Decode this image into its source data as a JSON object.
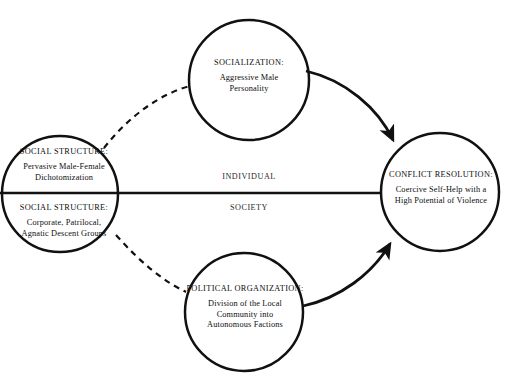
{
  "diagram": {
    "background_color": "#ffffff",
    "stroke_color": "#111111",
    "nodes": [
      {
        "id": "social-structure-dichotomization",
        "title": "SOCIAL STRUCTURE:",
        "lines": [
          "Pervasive Male-Female",
          "Dichotomization"
        ],
        "shape": "circle",
        "cx": 60,
        "cy": 194,
        "r": 58,
        "half": "individual"
      },
      {
        "id": "social-structure-descent-groups",
        "title": "SOCIAL STRUCTURE:",
        "lines": [
          "Corporate, Patrilocal,",
          "Agnatic Descent Groups"
        ],
        "shape": "circle",
        "cx": 60,
        "cy": 194,
        "r": 58,
        "half": "society"
      },
      {
        "id": "socialization",
        "title": "SOCIALIZATION:",
        "lines": [
          "Aggressive Male",
          "Personality"
        ],
        "shape": "circle",
        "cx": 249,
        "cy": 80,
        "r": 60,
        "half": "individual"
      },
      {
        "id": "political-organization",
        "title": "POLITICAL ORGANIZATION:",
        "lines": [
          "Division of the Local",
          "Community into",
          "Autonomous Factions"
        ],
        "shape": "circle",
        "cx": 244,
        "cy": 312,
        "r": 59,
        "half": "society"
      },
      {
        "id": "conflict-resolution",
        "title": "CONFLICT RESOLUTION:",
        "lines": [
          "Coercive Self-Help with a",
          "High Potential of Violence"
        ],
        "shape": "circle",
        "cx": 440,
        "cy": 192,
        "r": 59,
        "half": "both"
      }
    ],
    "divider": {
      "upper_label": "INDIVIDUAL",
      "lower_label": "SOCIETY",
      "y": 193,
      "x_start": 0,
      "x_end": 381,
      "style": "solid"
    },
    "edges": [
      {
        "id": "edge-structure-to-socialization",
        "from": "social-structure-dichotomization",
        "to": "socialization",
        "style": "dashed",
        "arrowhead": false
      },
      {
        "id": "edge-structure-to-political",
        "from": "social-structure-descent-groups",
        "to": "political-organization",
        "style": "dashed",
        "arrowhead": false
      },
      {
        "id": "edge-socialization-to-conflict",
        "from": "socialization",
        "to": "conflict-resolution",
        "style": "solid",
        "arrowhead": true
      },
      {
        "id": "edge-political-to-conflict",
        "from": "political-organization",
        "to": "conflict-resolution",
        "style": "solid",
        "arrowhead": true
      },
      {
        "id": "edge-structure-to-conflict",
        "from": "social-structure",
        "to": "conflict-resolution",
        "style": "solid",
        "arrowhead": false
      }
    ]
  }
}
